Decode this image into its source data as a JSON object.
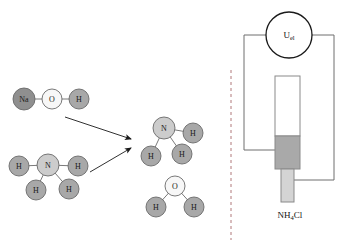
{
  "figure": {
    "background_color": "#ffffff"
  },
  "colors": {
    "atom_dark": "#8f8f8f",
    "atom_medium": "#a8a8a8",
    "atom_light": "#cccccc",
    "atom_white": "#f7f7f7",
    "atom_stroke": "#6a6a6a",
    "bond": "#7a7a7a",
    "arrow": "#1a1a1a",
    "wire": "#6f6f6f",
    "divider": "#b0787a",
    "electrode_fill": "#a9a9a9",
    "rod_fill": "#d4d4d4",
    "tube_fill": "#ffffff"
  },
  "left_panel": {
    "name": "reaction-scheme",
    "reactants": [
      {
        "name": "sodium-hydroxide",
        "formula": "NaOH",
        "atoms": [
          {
            "symbol": "Na",
            "x": 24,
            "y": 99,
            "r": 11,
            "shade": "atom_dark"
          },
          {
            "symbol": "O",
            "x": 52,
            "y": 99,
            "r": 10,
            "shade": "atom_white"
          },
          {
            "symbol": "H",
            "x": 79,
            "y": 99,
            "r": 10,
            "shade": "atom_medium"
          }
        ],
        "bonds": [
          [
            0,
            1
          ],
          [
            1,
            2
          ]
        ]
      },
      {
        "name": "ammonium-ion",
        "formula": "NH4",
        "atoms": [
          {
            "symbol": "N",
            "x": 48,
            "y": 165,
            "r": 11,
            "shade": "atom_light"
          },
          {
            "symbol": "H",
            "x": 19,
            "y": 166,
            "r": 10,
            "shade": "atom_medium"
          },
          {
            "symbol": "H",
            "x": 78,
            "y": 166,
            "r": 10,
            "shade": "atom_medium"
          },
          {
            "symbol": "H",
            "x": 36,
            "y": 190,
            "r": 10,
            "shade": "atom_medium"
          },
          {
            "symbol": "H",
            "x": 69,
            "y": 189,
            "r": 10,
            "shade": "atom_medium"
          }
        ],
        "bonds": [
          [
            0,
            1
          ],
          [
            0,
            2
          ],
          [
            0,
            3
          ],
          [
            0,
            4
          ]
        ]
      }
    ],
    "products": [
      {
        "name": "ammonia",
        "formula": "NH3",
        "atoms": [
          {
            "symbol": "N",
            "x": 164,
            "y": 128,
            "r": 11,
            "shade": "atom_light"
          },
          {
            "symbol": "H",
            "x": 193,
            "y": 133,
            "r": 10,
            "shade": "atom_medium"
          },
          {
            "symbol": "H",
            "x": 151,
            "y": 156,
            "r": 10,
            "shade": "atom_medium"
          },
          {
            "symbol": "H",
            "x": 182,
            "y": 154,
            "r": 10,
            "shade": "atom_medium"
          }
        ],
        "bonds": [
          [
            0,
            1
          ],
          [
            0,
            2
          ],
          [
            0,
            3
          ]
        ]
      },
      {
        "name": "water",
        "formula": "H2O",
        "atoms": [
          {
            "symbol": "O",
            "x": 175,
            "y": 186,
            "r": 10,
            "shade": "atom_white"
          },
          {
            "symbol": "H",
            "x": 156,
            "y": 207,
            "r": 10,
            "shade": "atom_medium"
          },
          {
            "symbol": "H",
            "x": 194,
            "y": 207,
            "r": 10,
            "shade": "atom_medium"
          }
        ],
        "bonds": [
          [
            0,
            1
          ],
          [
            0,
            2
          ]
        ]
      }
    ],
    "arrows": [
      {
        "name": "reaction-arrow-upper",
        "x1": 65,
        "y1": 117,
        "x2": 131,
        "y2": 139
      },
      {
        "name": "reaction-arrow-lower",
        "x1": 90,
        "y1": 172,
        "x2": 131,
        "y2": 148
      }
    ]
  },
  "divider": {
    "name": "panel-divider",
    "x": 231,
    "y1": 70,
    "y2": 240
  },
  "right_panel": {
    "name": "electrolysis-apparatus",
    "meter": {
      "name": "voltage-meter",
      "label_main": "U",
      "label_sub": "el",
      "cx": 289,
      "cy": 35,
      "r": 23
    },
    "sample_label": {
      "name": "sample-label",
      "main_1": "NH",
      "sub": "4",
      "main_2": "Cl",
      "x": 290,
      "y": 215
    },
    "tube": {
      "name": "glass-tube",
      "x": 275,
      "y": 76,
      "width": 25,
      "height": 60
    },
    "electrode": {
      "name": "electrode-block",
      "x": 275,
      "y": 136,
      "width": 25,
      "height": 33
    },
    "rod": {
      "name": "lower-rod",
      "x": 281,
      "y": 169,
      "width": 13,
      "height": 33
    },
    "wires": {
      "name": "circuit-wiring",
      "left_path": "M 266 35 L 244 35 L 244 150 L 277 150",
      "right_path": "M 312 35 L 334 35 L 334 180 L 289 180"
    }
  }
}
